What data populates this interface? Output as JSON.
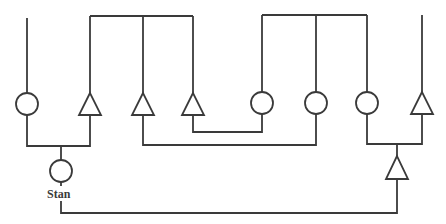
{
  "diagram": {
    "type": "pedigree",
    "line_color": "#3a3a3a",
    "background": "#ffffff",
    "labels": {
      "stan": "Stan"
    },
    "individuals": [
      {
        "id": "g1",
        "shape": "circle",
        "sex": "female",
        "x": 27
      },
      {
        "id": "g2",
        "shape": "triangle",
        "sex": "male",
        "x": 90
      },
      {
        "id": "g3",
        "shape": "triangle",
        "sex": "male",
        "x": 143
      },
      {
        "id": "g4",
        "shape": "triangle",
        "sex": "male",
        "x": 193
      },
      {
        "id": "g5",
        "shape": "circle",
        "sex": "female",
        "x": 262
      },
      {
        "id": "g6",
        "shape": "circle",
        "sex": "female",
        "x": 316
      },
      {
        "id": "g7",
        "shape": "circle",
        "sex": "female",
        "x": 367
      },
      {
        "id": "g8",
        "shape": "triangle",
        "sex": "male",
        "x": 422
      },
      {
        "id": "stan",
        "shape": "circle",
        "label": "Stan",
        "x": 61
      },
      {
        "id": "child-right",
        "shape": "triangle",
        "x": 397
      }
    ]
  }
}
